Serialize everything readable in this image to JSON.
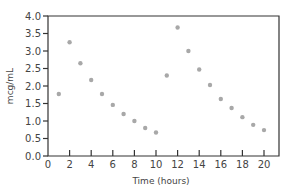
{
  "chart_data": {
    "type": "scatter",
    "title": "",
    "xlabel": "Time (hours)",
    "ylabel": "mcg/mL",
    "xlim": [
      0,
      21.4
    ],
    "ylim": [
      0,
      4.0
    ],
    "xticks": [
      0,
      2,
      4,
      6,
      8,
      10,
      12,
      14,
      16,
      18,
      20
    ],
    "yticks": [
      0.0,
      0.5,
      1.0,
      1.5,
      2.0,
      2.5,
      3.0,
      3.5,
      4.0
    ],
    "ytick_labels": [
      "0.0",
      "0.5",
      "1.0",
      "1.5",
      "2.0",
      "2.5",
      "3.0",
      "3.5",
      "4.0"
    ],
    "grid": false,
    "legend": null,
    "series": [
      {
        "name": "concentration",
        "color": "#a8a8a8",
        "x": [
          1,
          2,
          3,
          4,
          5,
          6,
          7,
          8,
          9,
          10,
          11,
          12,
          13,
          14,
          15,
          16,
          17,
          18,
          19,
          20
        ],
        "y": [
          1.77,
          3.25,
          2.65,
          2.17,
          1.77,
          1.46,
          1.2,
          1.0,
          0.8,
          0.67,
          2.3,
          3.67,
          3.0,
          2.47,
          2.03,
          1.63,
          1.37,
          1.11,
          0.89,
          0.74
        ]
      }
    ]
  }
}
